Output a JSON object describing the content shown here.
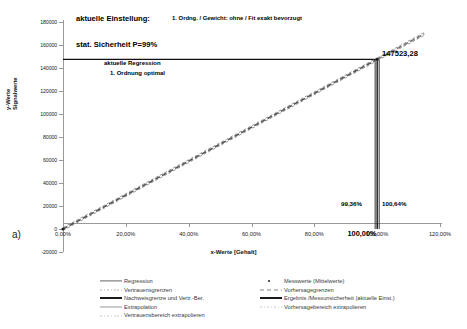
{
  "panel": {
    "label": "a)"
  },
  "annotations": {
    "setting_label": "aktuelle Einstellung:",
    "setting_value": "1. Ordng. / Gewicht: ohne / Fit exakt bevorzugt",
    "confidence": "stat. Sicherheit P=99%",
    "regression_line1": "aktuelle Regression",
    "regression_line2": "1. Ordnung optimal",
    "result_value": "147523,28",
    "lower_bound": "99,36%",
    "upper_bound": "100,64%",
    "center_value": "100,00%"
  },
  "chart_data": {
    "type": "line",
    "title": "",
    "xlabel": "x-Werte [Gehalt]",
    "ylabel": "y-Werte Signalwerte",
    "ylabel_lines": [
      "y-Werte",
      "Signalwerte"
    ],
    "xlim": [
      0,
      120
    ],
    "ylim": [
      -20000,
      180000
    ],
    "x_ticks": [
      0,
      20,
      40,
      60,
      80,
      100,
      120
    ],
    "x_tick_labels": [
      "0,00%",
      "20,00%",
      "40,00%",
      "60,00%",
      "80,00%",
      "100,00%",
      "120,00%"
    ],
    "y_ticks": [
      -20000,
      0,
      20000,
      40000,
      60000,
      80000,
      100000,
      120000,
      140000,
      160000,
      180000
    ],
    "y_tick_labels": [
      "-20000",
      "0",
      "20000",
      "40000",
      "60000",
      "80000",
      "100000",
      "120000",
      "140000",
      "160000",
      "180000"
    ],
    "grid": false,
    "legend_position": "bottom",
    "series": [
      {
        "name": "Regression",
        "type": "line",
        "x": [
          0,
          100
        ],
        "y": [
          0,
          147523.28
        ],
        "color": "#555555"
      },
      {
        "name": "Extrapolation",
        "type": "line",
        "x": [
          100,
          115
        ],
        "y": [
          147523.28,
          169651.77
        ],
        "color": "#777777"
      },
      {
        "name": "Messwerte (Mittelwerte)",
        "type": "scatter",
        "x": [
          0,
          100
        ],
        "y": [
          0,
          147523.28
        ],
        "color": "#222222"
      }
    ],
    "reference_lines": {
      "horizontal_result": 147523.28,
      "vertical_center": 100.0,
      "vertical_lower": 99.36,
      "vertical_upper": 100.64
    }
  },
  "legend": {
    "left_column": [
      {
        "label": "Regression",
        "key": "solid-line-key",
        "color": "#666666",
        "style": "solid",
        "width": 1.2
      },
      {
        "label": "Vertrauensgrenzen",
        "key": "dotted-line-key",
        "color": "#b3b3b3",
        "style": "dotted",
        "width": 1
      },
      {
        "label": "Nachweisgrenze und Vertr.-Ber.",
        "key": "thick-solid-line-key",
        "color": "#1a1a1a",
        "style": "solid",
        "width": 2
      },
      {
        "label": "Extrapolation",
        "key": "light-line-key",
        "color": "#9a9a9a",
        "style": "solid",
        "width": 1
      },
      {
        "label": "Vertrauensbereich extrapolieren",
        "key": "faint-dotted-line-key",
        "color": "#c8c8c8",
        "style": "dotted",
        "width": 1
      }
    ],
    "right_column": [
      {
        "label": "Messwerte (Mittelwerte)",
        "key": "point-marker-key",
        "color": "#222222",
        "style": "dot",
        "width": 0
      },
      {
        "label": "Vorhersagegrenzen",
        "key": "dashed-line-key",
        "color": "#8a8a8a",
        "style": "dashed",
        "width": 1
      },
      {
        "label": "Ergebnis /Messunsicherheit (aktuelle Einst.)",
        "key": "thick-solid-line-key",
        "color": "#1a1a1a",
        "style": "solid",
        "width": 2
      },
      {
        "label": "Vorhersagebereich extrapolieren",
        "key": "faint-dotted-line-key",
        "color": "#c8c8c8",
        "style": "dotted",
        "width": 1
      }
    ]
  }
}
